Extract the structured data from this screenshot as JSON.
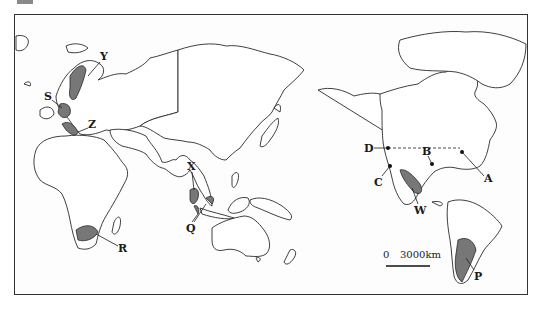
{
  "map": {
    "projection": "Pacific-centered world map",
    "scale_bar": {
      "zero": "0",
      "distance": "3000km"
    },
    "regions": [
      {
        "id": "S",
        "label": "S",
        "description": "shaded region in western/central Europe"
      },
      {
        "id": "Y",
        "label": "Y",
        "description": "shaded region in Scandinavia"
      },
      {
        "id": "Z",
        "label": "Z",
        "description": "shaded region in Italy"
      },
      {
        "id": "X",
        "label": "X",
        "description": "shaded region in mainland Southeast Asia"
      },
      {
        "id": "Q",
        "label": "Q",
        "description": "shaded regions in Malaysia / Indonesia"
      },
      {
        "id": "R",
        "label": "R",
        "description": "shaded region in South Africa"
      },
      {
        "id": "W",
        "label": "W",
        "description": "shaded region in Mexico"
      },
      {
        "id": "P",
        "label": "P",
        "description": "shaded region in Argentina"
      }
    ],
    "points": [
      {
        "id": "A",
        "label": "A",
        "description": "point on North American east coast"
      },
      {
        "id": "B",
        "label": "B",
        "description": "point on Gulf of Mexico coast"
      },
      {
        "id": "C",
        "label": "C",
        "description": "point on North American west coast"
      },
      {
        "id": "D",
        "label": "D",
        "description": "point on west coast at US-Canada border"
      }
    ],
    "boundary": "dashed line along US-Canada border"
  }
}
